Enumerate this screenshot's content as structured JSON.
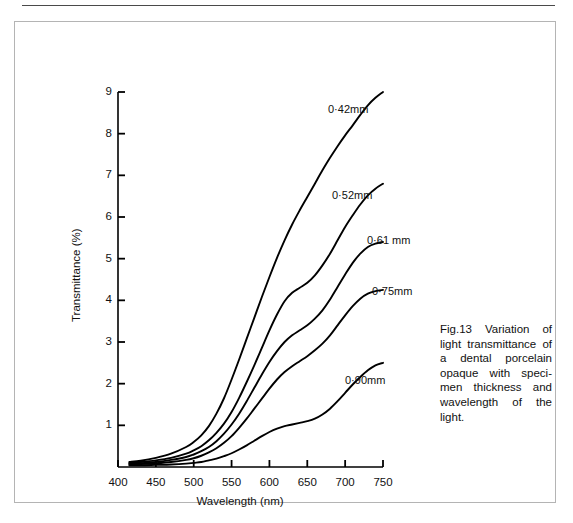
{
  "page": {
    "width": 573,
    "height": 523,
    "background": "#ffffff",
    "rule_color": "#4a4a4a",
    "frame_color": "#b4b4b4"
  },
  "caption": {
    "text": "Fig.13 Variation of light transmittance of a dental porcelain opaque with speci-men thickness and wavelength of the light."
  },
  "chart_data": {
    "type": "line",
    "title": "",
    "xlabel": "Wavelength (nm)",
    "ylabel": "Transmittance (%)",
    "xlim": [
      400,
      750
    ],
    "ylim": [
      0,
      9
    ],
    "xticks": [
      400,
      450,
      500,
      550,
      600,
      650,
      700,
      750
    ],
    "yticks": [
      1,
      2,
      3,
      4,
      5,
      6,
      7,
      8,
      9
    ],
    "grid": false,
    "legend": "inline-curve-labels",
    "line_color": "#000000",
    "series": [
      {
        "name": "0·42mm",
        "label": "0·42mm",
        "x": [
          415,
          430,
          450,
          470,
          490,
          500,
          510,
          520,
          530,
          540,
          550,
          560,
          570,
          580,
          590,
          600,
          610,
          620,
          630,
          640,
          650,
          660,
          670,
          680,
          690,
          700,
          710,
          720,
          730,
          740,
          750
        ],
        "y": [
          0.12,
          0.15,
          0.22,
          0.32,
          0.48,
          0.6,
          0.76,
          0.98,
          1.28,
          1.65,
          2.1,
          2.58,
          3.08,
          3.58,
          4.08,
          4.56,
          5.02,
          5.44,
          5.82,
          6.16,
          6.48,
          6.8,
          7.12,
          7.42,
          7.7,
          7.96,
          8.2,
          8.45,
          8.68,
          8.86,
          9.0
        ]
      },
      {
        "name": "0·52mm",
        "label": "0·52mm",
        "x": [
          415,
          430,
          450,
          470,
          490,
          500,
          510,
          520,
          530,
          540,
          550,
          560,
          570,
          580,
          590,
          600,
          610,
          620,
          630,
          640,
          650,
          660,
          670,
          680,
          690,
          700,
          710,
          720,
          730,
          740,
          750
        ],
        "y": [
          0.1,
          0.12,
          0.16,
          0.22,
          0.32,
          0.4,
          0.5,
          0.64,
          0.82,
          1.04,
          1.32,
          1.66,
          2.04,
          2.44,
          2.86,
          3.28,
          3.66,
          3.98,
          4.18,
          4.3,
          4.42,
          4.6,
          4.84,
          5.12,
          5.44,
          5.76,
          6.04,
          6.3,
          6.52,
          6.68,
          6.8
        ]
      },
      {
        "name": "0·61 mm",
        "label": "0·61 mm",
        "x": [
          415,
          430,
          450,
          470,
          490,
          500,
          510,
          520,
          530,
          540,
          550,
          560,
          570,
          580,
          590,
          600,
          610,
          620,
          630,
          640,
          650,
          660,
          670,
          680,
          690,
          700,
          710,
          720,
          730,
          740,
          750
        ],
        "y": [
          0.08,
          0.09,
          0.12,
          0.17,
          0.24,
          0.3,
          0.38,
          0.48,
          0.62,
          0.8,
          1.02,
          1.28,
          1.58,
          1.9,
          2.22,
          2.52,
          2.78,
          3.0,
          3.16,
          3.28,
          3.4,
          3.56,
          3.76,
          4.02,
          4.32,
          4.62,
          4.9,
          5.12,
          5.28,
          5.36,
          5.4
        ]
      },
      {
        "name": "0·75mm",
        "label": "0·75mm",
        "x": [
          415,
          430,
          450,
          470,
          490,
          500,
          510,
          520,
          530,
          540,
          550,
          560,
          570,
          580,
          590,
          600,
          610,
          620,
          630,
          640,
          650,
          660,
          670,
          680,
          690,
          700,
          710,
          720,
          730,
          740,
          750
        ],
        "y": [
          0.06,
          0.07,
          0.09,
          0.12,
          0.17,
          0.21,
          0.27,
          0.35,
          0.45,
          0.58,
          0.74,
          0.94,
          1.16,
          1.4,
          1.64,
          1.88,
          2.1,
          2.28,
          2.42,
          2.54,
          2.66,
          2.8,
          2.96,
          3.16,
          3.4,
          3.64,
          3.86,
          4.04,
          4.16,
          4.22,
          4.25
        ]
      },
      {
        "name": "0·90mm",
        "label": "0·90mm",
        "x": [
          415,
          430,
          450,
          470,
          490,
          500,
          510,
          520,
          530,
          540,
          550,
          560,
          570,
          580,
          590,
          600,
          610,
          620,
          630,
          640,
          650,
          660,
          670,
          680,
          690,
          700,
          710,
          720,
          730,
          740,
          750
        ],
        "y": [
          0.04,
          0.04,
          0.05,
          0.06,
          0.08,
          0.1,
          0.12,
          0.16,
          0.2,
          0.26,
          0.33,
          0.42,
          0.52,
          0.63,
          0.74,
          0.84,
          0.92,
          0.98,
          1.02,
          1.06,
          1.1,
          1.16,
          1.26,
          1.4,
          1.58,
          1.78,
          1.98,
          2.16,
          2.32,
          2.44,
          2.5
        ]
      }
    ],
    "annotations": [
      {
        "text": "0·42mm",
        "x_px": 313,
        "y_px": 81
      },
      {
        "text": "0·52mm",
        "x_px": 317,
        "y_px": 167
      },
      {
        "text": "0·61 mm",
        "x_px": 352,
        "y_px": 212
      },
      {
        "text": "0·75mm",
        "x_px": 357,
        "y_px": 263
      },
      {
        "text": "0·90mm",
        "x_px": 330,
        "y_px": 352
      }
    ]
  }
}
